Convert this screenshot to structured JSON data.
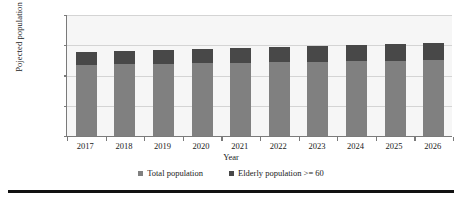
{
  "chart_data": {
    "type": "bar",
    "subtype": "stacked-vertical",
    "title": "",
    "xlabel": "Year",
    "ylabel": "Pojected population",
    "categories": [
      "2017",
      "2018",
      "2019",
      "2020",
      "2021",
      "2022",
      "2023",
      "2024",
      "2025",
      "2026"
    ],
    "series": [
      {
        "name": "Total population",
        "color": "#808080",
        "values": [
          4750000,
          4800000,
          4850000,
          4880000,
          4920000,
          4950000,
          4990000,
          5020000,
          5050000,
          5080000
        ]
      },
      {
        "name": "Elderly population >= 60",
        "color": "#484848",
        "values": [
          850000,
          880000,
          910000,
          950000,
          990000,
          1020000,
          1060000,
          1090000,
          1120000,
          1150000
        ]
      }
    ],
    "totals": [
      5600000,
      5680000,
      5760000,
      5830000,
      5910000,
      5970000,
      6050000,
      6110000,
      6170000,
      6230000
    ],
    "ylim": [
      0,
      8000000
    ],
    "yticks": [
      0,
      2000000,
      4000000,
      6000000,
      8000000
    ],
    "ytick_labels": [
      "0",
      "2,000,000",
      "4,000,000",
      "6,000,000",
      "8,000,000"
    ],
    "grid": true,
    "grid_axis": "y",
    "legend_position": "bottom"
  },
  "legend": {
    "entries": [
      {
        "label": "Total population",
        "color": "#808080"
      },
      {
        "label": "Elderly population >= 60",
        "color": "#484848"
      }
    ]
  },
  "axes": {
    "x_title": "Year",
    "y_title": "Pojected population"
  }
}
